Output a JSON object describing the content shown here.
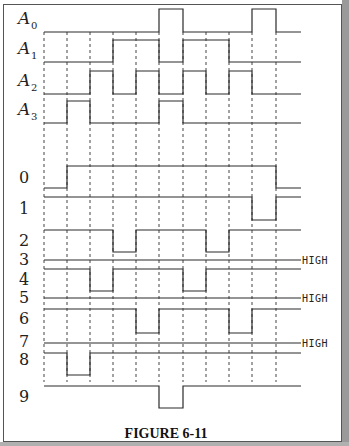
{
  "figure": {
    "caption": "FIGURE 6-11",
    "high_label": "HIGH",
    "grid_x": [
      44,
      67,
      90,
      113,
      136,
      159,
      183,
      206,
      229,
      252,
      276
    ],
    "line_start": 44,
    "line_end": 301,
    "grid_top": 32,
    "grid_bottom": 382
  },
  "inputs": [
    {
      "name": "A",
      "sub": "0",
      "label_y": 24,
      "high_y": 9,
      "low_y": 32,
      "high_intervals": [
        [
          159,
          183
        ],
        [
          252,
          276
        ]
      ]
    },
    {
      "name": "A",
      "sub": "1",
      "label_y": 54,
      "high_y": 40,
      "low_y": 62,
      "high_intervals": [
        [
          113,
          159
        ],
        [
          183,
          229
        ]
      ]
    },
    {
      "name": "A",
      "sub": "2",
      "label_y": 86,
      "high_y": 71,
      "low_y": 94,
      "high_intervals": [
        [
          90,
          113
        ],
        [
          136,
          159
        ],
        [
          183,
          206
        ],
        [
          229,
          252
        ]
      ]
    },
    {
      "name": "A",
      "sub": "3",
      "label_y": 115,
      "high_y": 101,
      "low_y": 123,
      "high_intervals": [
        [
          67,
          90
        ],
        [
          159,
          183
        ]
      ]
    }
  ],
  "outputs": [
    {
      "label": "0",
      "label_y": 183,
      "high_y": 166,
      "low_y": 188,
      "low_intervals": [
        [
          44,
          67
        ],
        [
          276,
          301
        ]
      ],
      "constant": false
    },
    {
      "label": "1",
      "label_y": 214,
      "high_y": 197,
      "low_y": 220,
      "low_intervals": [
        [
          252,
          276
        ]
      ],
      "constant": false
    },
    {
      "label": "2",
      "label_y": 246,
      "high_y": 230,
      "low_y": 252,
      "low_intervals": [
        [
          113,
          136
        ],
        [
          206,
          229
        ]
      ],
      "constant": false
    },
    {
      "label": "3",
      "label_y": 265,
      "high_y": 260,
      "low_y": 260,
      "low_intervals": [],
      "constant": true
    },
    {
      "label": "4",
      "label_y": 285,
      "high_y": 269,
      "low_y": 291,
      "low_intervals": [
        [
          90,
          113
        ],
        [
          183,
          206
        ]
      ],
      "constant": false
    },
    {
      "label": "5",
      "label_y": 303,
      "high_y": 298,
      "low_y": 298,
      "low_intervals": [],
      "constant": true
    },
    {
      "label": "6",
      "label_y": 324,
      "high_y": 309,
      "low_y": 333,
      "low_intervals": [
        [
          136,
          159
        ],
        [
          229,
          252
        ]
      ],
      "constant": false
    },
    {
      "label": "7",
      "label_y": 347,
      "high_y": 343,
      "low_y": 343,
      "low_intervals": [],
      "constant": true
    },
    {
      "label": "8",
      "label_y": 365,
      "high_y": 353,
      "low_y": 375,
      "low_intervals": [
        [
          67,
          90
        ]
      ],
      "constant": false
    },
    {
      "label": "9",
      "label_y": 402,
      "high_y": 386,
      "low_y": 408,
      "low_intervals": [
        [
          159,
          183
        ]
      ],
      "constant": false
    }
  ]
}
